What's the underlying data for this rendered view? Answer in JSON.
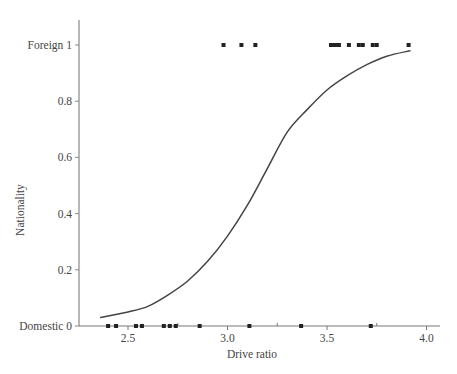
{
  "chart_data": {
    "type": "scatter",
    "title": "",
    "xlabel": "Drive ratio",
    "ylabel": "Nationality",
    "xlim": [
      2.3,
      4.05
    ],
    "ylim": [
      0,
      1.1
    ],
    "grid": false,
    "x_ticks": [
      2.5,
      3.0,
      3.5,
      4.0
    ],
    "x_tick_labels": [
      "2.5",
      "3.0",
      "3.5",
      "4.0"
    ],
    "x_minor_ticks": [
      2.75,
      3.25,
      3.75
    ],
    "y_ticks": [
      0,
      0.2,
      0.4,
      0.6,
      0.8,
      1
    ],
    "y_tick_labels": [
      "Domestic 0",
      "0.2",
      "0.4",
      "0.6",
      "0.8",
      "Foreign 1"
    ],
    "series": [
      {
        "name": "Foreign (observed)",
        "kind": "points",
        "y": 1,
        "x": [
          2.98,
          3.07,
          3.14,
          3.52,
          3.54,
          3.56,
          3.61,
          3.66,
          3.68,
          3.73,
          3.75,
          3.91
        ]
      },
      {
        "name": "Domestic (observed)",
        "kind": "points",
        "y": 0,
        "x": [
          2.4,
          2.44,
          2.54,
          2.57,
          2.68,
          2.71,
          2.74,
          2.86,
          3.11,
          3.37,
          3.72
        ]
      },
      {
        "name": "Fitted logistic curve",
        "kind": "line",
        "x": [
          2.36,
          2.5,
          2.6,
          2.7,
          2.8,
          2.9,
          3.0,
          3.1,
          3.2,
          3.3,
          3.4,
          3.5,
          3.6,
          3.7,
          3.8,
          3.92
        ],
        "y": [
          0.03,
          0.05,
          0.07,
          0.11,
          0.16,
          0.23,
          0.32,
          0.43,
          0.56,
          0.69,
          0.77,
          0.84,
          0.89,
          0.93,
          0.96,
          0.98
        ]
      }
    ]
  }
}
